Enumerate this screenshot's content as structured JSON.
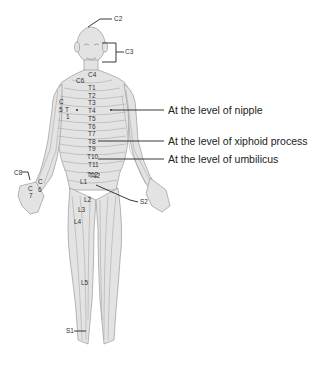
{
  "head_labels": {
    "c2": "C2",
    "c3": "C3"
  },
  "neck_labels": {
    "c4": "C4",
    "c6": "C6"
  },
  "trunk_labels": [
    "T1",
    "T2",
    "T3",
    "T4",
    "T5",
    "T6",
    "T7",
    "T8",
    "T9",
    "T10",
    "T11",
    "T12"
  ],
  "arm_labels": {
    "c5": "C",
    "c5b": "5",
    "t1": "T",
    "t1b": "1"
  },
  "hand_labels": {
    "c8": "C8",
    "c6a": "C",
    "c6b": "6",
    "c7a": "C",
    "c7b": "7"
  },
  "leg_labels": {
    "l1": "L1",
    "l2": "L2",
    "l3": "L3",
    "l4": "L4",
    "l5": "L5",
    "s1": "S1",
    "s2": "S2",
    "t12b": "T12"
  },
  "annotations": {
    "nipple": "At the level of nipple",
    "xiphoid": "At the level of xiphoid process",
    "umbilicus": "At the level of umbilicus"
  }
}
